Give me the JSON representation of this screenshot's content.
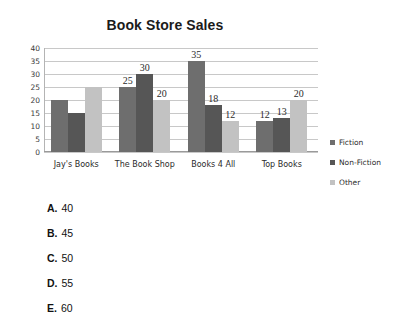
{
  "chart_data": {
    "type": "bar",
    "title": "Book Store Sales",
    "xlabel": "",
    "ylabel": "",
    "ylim": [
      0,
      40
    ],
    "ytick_step": 5,
    "yticks": [
      40,
      35,
      30,
      25,
      20,
      15,
      10,
      5,
      0
    ],
    "grid": true,
    "legend_position": "right",
    "categories": [
      "Jay's Books",
      "The Book Shop",
      "Books 4 All",
      "Top Books"
    ],
    "series": [
      {
        "name": "Fiction",
        "color": "#6e6e6e",
        "values": [
          20,
          25,
          35,
          12
        ]
      },
      {
        "name": "Non-Fiction",
        "color": "#565656",
        "values": [
          15,
          30,
          18,
          13
        ]
      },
      {
        "name": "Other",
        "color": "#c2c2c2",
        "values": [
          25,
          20,
          12,
          20
        ]
      }
    ],
    "data_labels": [
      {
        "text": "25",
        "group": 1,
        "series": 0
      },
      {
        "text": "30",
        "group": 1,
        "series": 1
      },
      {
        "text": "20",
        "group": 1,
        "series": 2
      },
      {
        "text": "35",
        "group": 2,
        "series": 0
      },
      {
        "text": "18",
        "group": 2,
        "series": 1
      },
      {
        "text": "12",
        "group": 2,
        "series": 2
      },
      {
        "text": "12",
        "group": 3,
        "series": 0
      },
      {
        "text": "13",
        "group": 3,
        "series": 1
      },
      {
        "text": "20",
        "group": 3,
        "series": 2
      }
    ]
  },
  "options": [
    {
      "letter": "A.",
      "value": "40"
    },
    {
      "letter": "B.",
      "value": "45"
    },
    {
      "letter": "C.",
      "value": "50"
    },
    {
      "letter": "D.",
      "value": "55"
    },
    {
      "letter": "E.",
      "value": "60"
    }
  ]
}
